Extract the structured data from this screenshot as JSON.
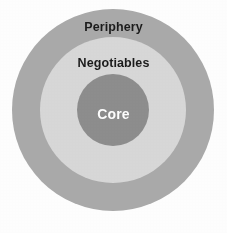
{
  "diagram": {
    "type": "concentric-circles",
    "title": "",
    "background_color": "#ffffff",
    "center": {
      "x": 113,
      "y": 110
    },
    "rings": [
      {
        "id": "periphery",
        "label": "Periphery",
        "level": 3,
        "position": "outer",
        "fill_color": "#ababab",
        "text_color": "#1c1c1c",
        "diameter_px": 202
      },
      {
        "id": "negotiables",
        "label": "Negotiables",
        "level": 2,
        "position": "middle",
        "fill_color": "#d9d9d9",
        "text_color": "#1c1c1c",
        "diameter_px": 146
      },
      {
        "id": "core",
        "label": "Core",
        "level": 1,
        "position": "inner",
        "fill_color": "#8e8e8e",
        "text_color": "#ffffff",
        "diameter_px": 72
      }
    ]
  }
}
